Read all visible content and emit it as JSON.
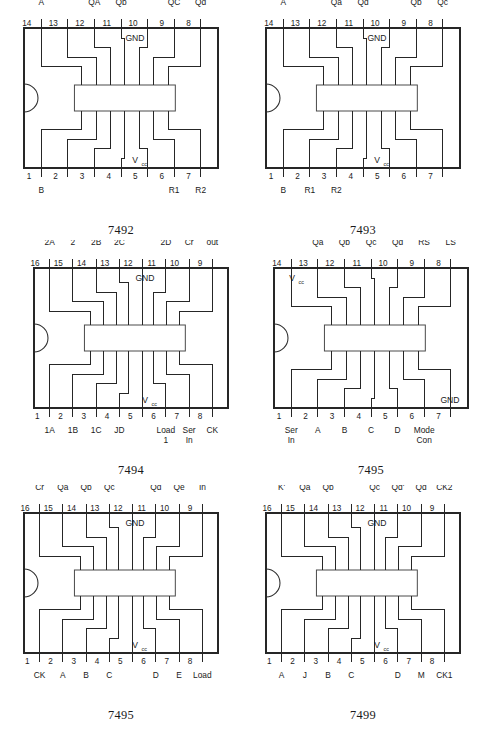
{
  "page": {
    "kind": "ic-pinout-reference-sheet",
    "background_color": "#ffffff",
    "ink_color": "#262626",
    "columns": 2,
    "rows": 3
  },
  "chips": [
    {
      "id": "chip-7492",
      "caption": "7492",
      "pin_count": 14,
      "top_rail_label": "GND",
      "bottom_rail_label": "V",
      "bottom_rail_sub": "cc",
      "top_pins": [
        {
          "num": "14",
          "label": "A"
        },
        {
          "num": "13",
          "label": ""
        },
        {
          "num": "12",
          "label": "QA"
        },
        {
          "num": "11",
          "label": "Qb"
        },
        {
          "num": "10",
          "label": ""
        },
        {
          "num": "9",
          "label": "QC"
        },
        {
          "num": "8",
          "label": "Qd"
        }
      ],
      "bottom_pins": [
        {
          "num": "1",
          "label": "B"
        },
        {
          "num": "2",
          "label": ""
        },
        {
          "num": "3",
          "label": ""
        },
        {
          "num": "4",
          "label": ""
        },
        {
          "num": "5",
          "label": ""
        },
        {
          "num": "6",
          "label": "R1"
        },
        {
          "num": "7",
          "label": "R2"
        }
      ]
    },
    {
      "id": "chip-7493",
      "caption": "7493",
      "pin_count": 14,
      "top_rail_label": "GND",
      "bottom_rail_label": "V",
      "bottom_rail_sub": "cc",
      "top_pins": [
        {
          "num": "14",
          "label": "A"
        },
        {
          "num": "13",
          "label": ""
        },
        {
          "num": "12",
          "label": "Qa"
        },
        {
          "num": "11",
          "label": "Qd"
        },
        {
          "num": "10",
          "label": ""
        },
        {
          "num": "9",
          "label": "Qb"
        },
        {
          "num": "8",
          "label": "Qc"
        }
      ],
      "bottom_pins": [
        {
          "num": "1",
          "label": "B"
        },
        {
          "num": "2",
          "label": "R1"
        },
        {
          "num": "3",
          "label": "R2"
        },
        {
          "num": "4",
          "label": ""
        },
        {
          "num": "5",
          "label": ""
        },
        {
          "num": "6",
          "label": ""
        },
        {
          "num": "7",
          "label": ""
        }
      ]
    },
    {
      "id": "chip-7494",
      "caption": "7494",
      "pin_count": 16,
      "top_rail_label": "GND",
      "bottom_rail_label": "V",
      "bottom_rail_sub": "cc",
      "top_pins": [
        {
          "num": "16",
          "label": "Pr\n2A"
        },
        {
          "num": "15",
          "label": "Load\n2"
        },
        {
          "num": "14",
          "label": "Pr\n2B"
        },
        {
          "num": "13",
          "label": "Pr\n2C"
        },
        {
          "num": "12",
          "label": ""
        },
        {
          "num": "11",
          "label": "Pr\n2D"
        },
        {
          "num": "10",
          "label": "Cr"
        },
        {
          "num": "9",
          "label": "out"
        }
      ],
      "bottom_pins": [
        {
          "num": "1",
          "label": "1A"
        },
        {
          "num": "2",
          "label": "1B"
        },
        {
          "num": "3",
          "label": "1C"
        },
        {
          "num": "4",
          "label": "JD"
        },
        {
          "num": "5",
          "label": ""
        },
        {
          "num": "6",
          "label": "Load\n1"
        },
        {
          "num": "7",
          "label": "Ser\nIn"
        },
        {
          "num": "8",
          "label": "CK"
        }
      ]
    },
    {
      "id": "chip-7495-a",
      "caption": "7495",
      "pin_count": 14,
      "top_rail_label": "V",
      "top_rail_sub": "cc",
      "bottom_rail_label": "GND",
      "top_pins": [
        {
          "num": "14",
          "label": ""
        },
        {
          "num": "13",
          "label": "Qa"
        },
        {
          "num": "12",
          "label": "Qb"
        },
        {
          "num": "11",
          "label": "Qc"
        },
        {
          "num": "10",
          "label": "Qd"
        },
        {
          "num": "9",
          "label": "CK1\nRS"
        },
        {
          "num": "8",
          "label": "CK2\nLS"
        }
      ],
      "bottom_pins": [
        {
          "num": "1",
          "label": "Ser\nIn"
        },
        {
          "num": "2",
          "label": "A"
        },
        {
          "num": "3",
          "label": "B"
        },
        {
          "num": "4",
          "label": "C"
        },
        {
          "num": "5",
          "label": "D"
        },
        {
          "num": "6",
          "label": "Mode\nCon"
        },
        {
          "num": "7",
          "label": ""
        }
      ]
    },
    {
      "id": "chip-7495-b",
      "caption": "7495",
      "pin_count": 16,
      "top_rail_label": "GND",
      "bottom_rail_label": "V",
      "bottom_rail_sub": "cc",
      "top_pins": [
        {
          "num": "16",
          "label": "Cr"
        },
        {
          "num": "15",
          "label": "Qa"
        },
        {
          "num": "14",
          "label": "Qb"
        },
        {
          "num": "13",
          "label": "Qc"
        },
        {
          "num": "12",
          "label": ""
        },
        {
          "num": "11",
          "label": "Qd"
        },
        {
          "num": "10",
          "label": "Qe"
        },
        {
          "num": "9",
          "label": "Ser\nIn"
        }
      ],
      "bottom_pins": [
        {
          "num": "1",
          "label": "CK"
        },
        {
          "num": "2",
          "label": "A"
        },
        {
          "num": "3",
          "label": "B"
        },
        {
          "num": "4",
          "label": "C"
        },
        {
          "num": "5",
          "label": ""
        },
        {
          "num": "6",
          "label": "D"
        },
        {
          "num": "7",
          "label": "E"
        },
        {
          "num": "8",
          "label": "Load"
        }
      ]
    },
    {
      "id": "chip-7499",
      "caption": "7499",
      "pin_count": 16,
      "top_rail_label": "GND",
      "bottom_rail_label": "V",
      "bottom_rail_sub": "cc",
      "top_pins": [
        {
          "num": "16",
          "label": "K'"
        },
        {
          "num": "15",
          "label": "Qa"
        },
        {
          "num": "14",
          "label": "Qb"
        },
        {
          "num": "13",
          "label": ""
        },
        {
          "num": "12",
          "label": "Qc"
        },
        {
          "num": "11",
          "label": "Qd'"
        },
        {
          "num": "10",
          "label": "Qd"
        },
        {
          "num": "9",
          "label": "CK2"
        }
      ],
      "bottom_pins": [
        {
          "num": "1",
          "label": "A"
        },
        {
          "num": "2",
          "label": "J"
        },
        {
          "num": "3",
          "label": "B"
        },
        {
          "num": "4",
          "label": "C"
        },
        {
          "num": "5",
          "label": ""
        },
        {
          "num": "6",
          "label": "D"
        },
        {
          "num": "7",
          "label": "M"
        },
        {
          "num": "8",
          "label": "CK1"
        }
      ]
    }
  ]
}
